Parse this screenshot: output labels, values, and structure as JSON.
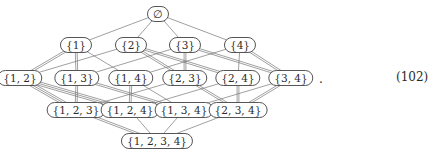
{
  "diagram": {
    "type": "hasse-diagram",
    "nodes": [
      {
        "id": "e",
        "label": "∅",
        "x": 158,
        "y": 14
      },
      {
        "id": "1",
        "label": "{1}",
        "x": 76,
        "y": 45
      },
      {
        "id": "2",
        "label": "{2}",
        "x": 131,
        "y": 45
      },
      {
        "id": "3",
        "label": "{3}",
        "x": 185,
        "y": 45
      },
      {
        "id": "4",
        "label": "{4}",
        "x": 240,
        "y": 45
      },
      {
        "id": "12",
        "label": "{1, 2}",
        "x": 20,
        "y": 78
      },
      {
        "id": "13",
        "label": "{1, 3}",
        "x": 77,
        "y": 78
      },
      {
        "id": "14",
        "label": "{1, 4}",
        "x": 131,
        "y": 78
      },
      {
        "id": "23",
        "label": "{2, 3}",
        "x": 185,
        "y": 78
      },
      {
        "id": "24",
        "label": "{2, 4}",
        "x": 238,
        "y": 78
      },
      {
        "id": "34",
        "label": "{3, 4}",
        "x": 291,
        "y": 78
      },
      {
        "id": "123",
        "label": "{1, 2, 3}",
        "x": 76,
        "y": 110
      },
      {
        "id": "124",
        "label": "{1, 2, 4}",
        "x": 130,
        "y": 110
      },
      {
        "id": "134",
        "label": "{1, 3, 4}",
        "x": 184,
        "y": 110
      },
      {
        "id": "234",
        "label": "{2, 3, 4}",
        "x": 238,
        "y": 110
      },
      {
        "id": "1234",
        "label": "{1, 2, 3, 4}",
        "x": 157,
        "y": 141
      }
    ],
    "edges": [
      [
        "e",
        "1",
        1
      ],
      [
        "e",
        "2",
        1
      ],
      [
        "e",
        "3",
        1
      ],
      [
        "e",
        "4",
        1
      ],
      [
        "1",
        "12",
        2
      ],
      [
        "1",
        "13",
        2
      ],
      [
        "1",
        "14",
        1
      ],
      [
        "2",
        "12",
        1
      ],
      [
        "2",
        "23",
        2
      ],
      [
        "2",
        "24",
        2
      ],
      [
        "3",
        "13",
        1
      ],
      [
        "3",
        "23",
        2
      ],
      [
        "3",
        "34",
        2
      ],
      [
        "4",
        "14",
        1
      ],
      [
        "4",
        "24",
        1
      ],
      [
        "4",
        "34",
        2
      ],
      [
        "12",
        "123",
        3
      ],
      [
        "12",
        "124",
        3
      ],
      [
        "13",
        "123",
        2
      ],
      [
        "13",
        "134",
        2
      ],
      [
        "14",
        "124",
        2
      ],
      [
        "14",
        "134",
        1
      ],
      [
        "23",
        "123",
        1
      ],
      [
        "23",
        "234",
        2
      ],
      [
        "24",
        "124",
        1
      ],
      [
        "24",
        "234",
        2
      ],
      [
        "34",
        "134",
        1
      ],
      [
        "34",
        "234",
        2
      ],
      [
        "123",
        "1234",
        2
      ],
      [
        "124",
        "1234",
        1
      ],
      [
        "134",
        "1234",
        1
      ],
      [
        "234",
        "1234",
        1
      ]
    ]
  },
  "trailing_punctuation": ".",
  "equation_number": "(102)"
}
